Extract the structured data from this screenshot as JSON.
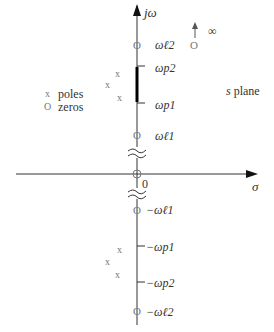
{
  "diagram": {
    "title": "s plane",
    "axes": {
      "vertical_label": "jω",
      "horizontal_label": "σ",
      "origin_label": "0"
    },
    "infinity_label": "∞",
    "legend": {
      "poles_symbol": "x",
      "poles_label": "poles",
      "zeros_symbol": "O",
      "zeros_label": "zeros"
    },
    "upper_labels": {
      "w_l2": "ωℓ2",
      "w_p2": "ωp2",
      "w_p1": "ωp1",
      "w_l1": "ωℓ1"
    },
    "lower_labels": {
      "w_l1": "−ωℓ1",
      "w_p1": "−ωp1",
      "w_p2": "−ωp2",
      "w_l2": "−ωℓ2"
    },
    "pole_glyph": "x",
    "zero_glyph": "O",
    "colors": {
      "axis": "#222222",
      "marker": "#888888",
      "text": "#333333"
    }
  }
}
